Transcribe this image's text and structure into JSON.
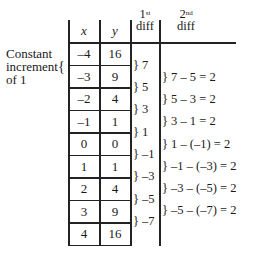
{
  "side_label": {
    "line1": "Constant",
    "line2": "increment",
    "line3": "of 1",
    "brace": "{"
  },
  "table": {
    "headers": {
      "x": "x",
      "y": "y"
    },
    "rows": [
      {
        "x": "–4",
        "y": "16"
      },
      {
        "x": "–3",
        "y": "9"
      },
      {
        "x": "–2",
        "y": "4"
      },
      {
        "x": "–1",
        "y": "1"
      },
      {
        "x": "0",
        "y": "0"
      },
      {
        "x": "1",
        "y": "1"
      },
      {
        "x": "2",
        "y": "4"
      },
      {
        "x": "3",
        "y": "9"
      },
      {
        "x": "4",
        "y": "16"
      }
    ]
  },
  "first_diff": {
    "header_sup": "st",
    "header_num": "1",
    "header_text": "diff",
    "values": [
      "} 7",
      "} 5",
      "} 3",
      "} 1",
      "} –1",
      "} –3",
      "} –5",
      "} –7"
    ]
  },
  "second_diff": {
    "header_sup": "nd",
    "header_num": "2",
    "header_text": "diff",
    "values": [
      "} 7 – 5 = 2",
      "} 5 – 3 = 2",
      "} 3 – 1 = 2",
      "} 1 – (–1) = 2",
      "} –1 – (–3) = 2",
      "} –3 – (–5) = 2",
      "} –5 – (–7) = 2"
    ]
  }
}
